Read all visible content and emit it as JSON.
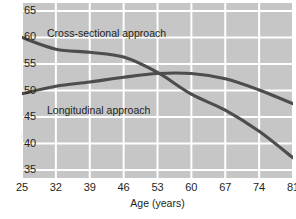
{
  "chart_data": {
    "type": "line",
    "title": "",
    "xlabel": "Age (years)",
    "ylabel": "Reasoning ability score",
    "x": [
      25,
      32,
      39,
      46,
      53,
      60,
      67,
      74,
      81
    ],
    "xticklabels": [
      "25",
      "32",
      "39",
      "46",
      "53",
      "60",
      "67",
      "74",
      "81"
    ],
    "yticklabels": [
      "65",
      "60",
      "55",
      "50",
      "45",
      "40",
      "35"
    ],
    "yticks": [
      65,
      60,
      55,
      50,
      45,
      40,
      35
    ],
    "xlim": [
      25,
      81
    ],
    "ylim": [
      33.5,
      66.5
    ],
    "grid": true,
    "legend_position": "in-plot annotations",
    "series": [
      {
        "name": "Cross-sectional approach",
        "color": "#4d4d4d",
        "values": [
          60.0,
          57.8,
          57.2,
          56.3,
          53.4,
          49.3,
          46.3,
          42.3,
          37.3
        ]
      },
      {
        "name": "Longitudinal approach",
        "color": "#4d4d4d",
        "values": [
          49.4,
          50.8,
          51.6,
          52.5,
          53.2,
          53.2,
          52.2,
          50.1,
          47.5
        ]
      }
    ],
    "annotations": [
      {
        "text": "Cross-sectional approach",
        "series": "Cross-sectional approach"
      },
      {
        "text": "Longitudinal approach",
        "series": "Longitudinal approach"
      }
    ],
    "panel_background": "#c6c6c6",
    "gridline_color": "#ffffff",
    "line_color": "#4d4d4d"
  },
  "figure": {
    "watermark": ""
  }
}
